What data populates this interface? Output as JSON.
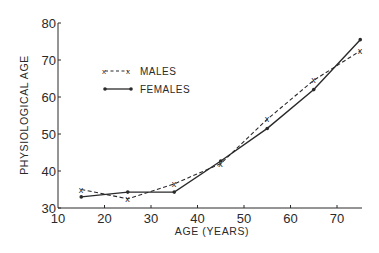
{
  "chart_data": {
    "type": "line",
    "title": "",
    "xlabel": "AGE (YEARS)",
    "ylabel": "PHYSIOLOGICAL AGE",
    "xlim": [
      10,
      75
    ],
    "ylim": [
      30,
      80
    ],
    "x_ticks": [
      10,
      20,
      30,
      40,
      50,
      60,
      70
    ],
    "y_ticks": [
      30,
      40,
      50,
      60,
      70,
      80
    ],
    "grid": false,
    "legend_position": "upper-left",
    "x": [
      15,
      25,
      35,
      45,
      55,
      65,
      75
    ],
    "series": [
      {
        "name": "MALES",
        "style": "dashed",
        "marker": "x",
        "values": [
          35,
          32.5,
          36.5,
          42,
          54,
          64.5,
          72.5
        ]
      },
      {
        "name": "FEMALES",
        "style": "solid",
        "marker": "dot",
        "values": [
          33,
          34.3,
          34.3,
          42.7,
          51.5,
          62,
          75.5
        ]
      }
    ]
  },
  "legend": {
    "males_label": "MALES",
    "females_label": "FEMALES",
    "males_marker": "x-x",
    "females_marker": "dot-dot"
  },
  "colors": {
    "ink": "#2a2a2a",
    "background": "#ffffff"
  }
}
